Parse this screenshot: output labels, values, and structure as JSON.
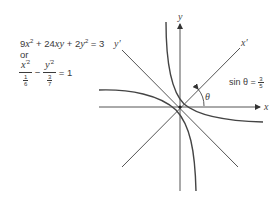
{
  "equations": {
    "general_form": {
      "coef_x2": "9",
      "var_x": "x",
      "plus1": "+",
      "coef_xy": "24",
      "var_xy": "xy",
      "plus2": "+",
      "coef_y2": "2",
      "var_y": "y",
      "equals": "=",
      "rhs": "3",
      "exp": "2"
    },
    "connector": "or",
    "standard_form": {
      "num1_var": "x",
      "num1_exp": "′2",
      "den1_num": "1",
      "den1_den": "6",
      "minus": "−",
      "num2_var": "y",
      "num2_exp": "′2",
      "den2_num": "3",
      "den2_den": "7",
      "equals": "=",
      "rhs": "1"
    }
  },
  "diagram": {
    "axis_labels": {
      "x": "x",
      "y": "y",
      "x_prime": "x′",
      "y_prime": "y′"
    },
    "angle_label": "θ",
    "annotation": {
      "lhs": "sin θ =",
      "num": "3",
      "den": "5"
    },
    "colors": {
      "stroke": "#555555",
      "curve": "#444444"
    }
  }
}
